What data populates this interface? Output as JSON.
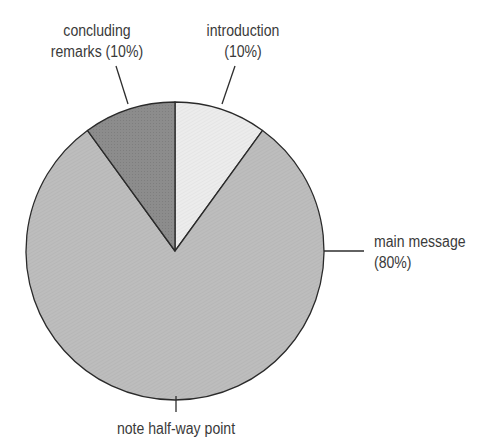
{
  "chart_data": {
    "type": "pie",
    "title": "",
    "start_angle_deg": 0,
    "direction": "clockwise",
    "slices": [
      {
        "label": "introduction",
        "percent_label": "(10%)",
        "value": 10,
        "color": "#ececec"
      },
      {
        "label": "main message",
        "percent_label": "(80%)",
        "value": 80,
        "color": "#bdbdbd"
      },
      {
        "label": "concluding",
        "label2": "remarks (10%)",
        "value": 10,
        "color": "#8a8a8a"
      }
    ],
    "annotations": [
      {
        "text": "note half-way point",
        "position": "bottom"
      }
    ],
    "legend": "none",
    "grid": false
  },
  "labels": {
    "concluding_line1": "concluding",
    "concluding_line2": "remarks (10%)",
    "introduction_line1": "introduction",
    "introduction_line2": "(10%)",
    "main_line1": "main message",
    "main_line2": "(80%)",
    "halfway": "note half-way point"
  }
}
